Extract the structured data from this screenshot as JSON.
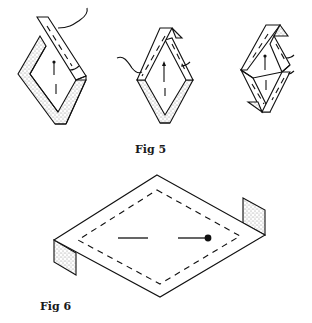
{
  "figures": [
    {
      "id": "fig5",
      "caption": "Fig 5",
      "description": "Three-step folding sequence of a diamond-shaped paper strip frame",
      "steps": [
        {
          "step": 1,
          "detail": "Diamond frame with one strip crossing the top, stippled underside visible, arrow pointing up, fold line marked"
        },
        {
          "step": 2,
          "detail": "Top corner folded over, stippled flap at upper right, arrow pointing up"
        },
        {
          "step": 3,
          "detail": "Compact folded diamond with stippled flaps at top-right and bottom-left, arrow pointing up"
        }
      ]
    },
    {
      "id": "fig6",
      "caption": "Fig 6",
      "description": "Flattened rhombus panel with dashed inner border, stippled end flaps folded down at left and right, a line segment and a line ending in a dot in the center"
    }
  ],
  "colors": {
    "ink": "#111111",
    "paper": "#ffffff"
  }
}
